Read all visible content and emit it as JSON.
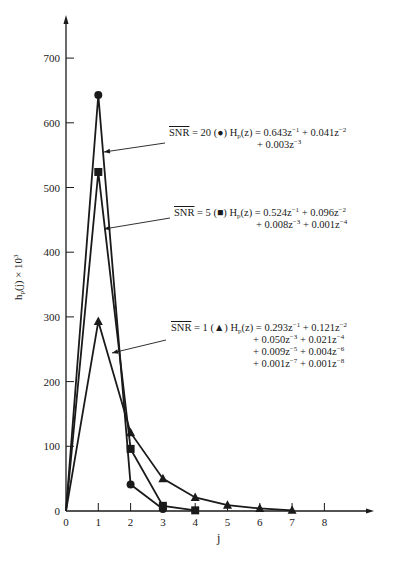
{
  "chart_data": {
    "type": "line",
    "title": "",
    "xlabel": "j",
    "ylabel": "h_p(j) × 10³",
    "xlim": [
      0,
      8.5
    ],
    "ylim": [
      0,
      750
    ],
    "x_ticks": [
      0,
      1,
      2,
      3,
      4,
      5,
      6,
      7,
      8
    ],
    "y_ticks": [
      0,
      100,
      200,
      300,
      400,
      500,
      600,
      700
    ],
    "grid": false,
    "legend": "inline annotations with arrows",
    "series": [
      {
        "name": "SNR = 20",
        "marker": "circle",
        "x": [
          0,
          1,
          2,
          3
        ],
        "values": [
          0,
          643,
          41,
          3
        ]
      },
      {
        "name": "SNR = 5",
        "marker": "square",
        "x": [
          0,
          1,
          2,
          3,
          4
        ],
        "values": [
          0,
          524,
          96,
          8,
          1
        ]
      },
      {
        "name": "SNR = 1",
        "marker": "triangle",
        "x": [
          0,
          1,
          2,
          3,
          4,
          5,
          6,
          7
        ],
        "values": [
          0,
          293,
          121,
          50,
          21,
          9,
          4,
          1
        ]
      }
    ],
    "annotations": [
      {
        "snr": "SNR",
        "snr_value": "= 20",
        "marker_glyph": "(●)",
        "lines": [
          "H_p(z) = 0.643z⁻¹ + 0.041z⁻²",
          "+ 0.003z⁻³"
        ]
      },
      {
        "snr": "SNR",
        "snr_value": "= 5",
        "marker_glyph": "(■)",
        "lines": [
          "H_p(z) = 0.524z⁻¹ + 0.096z⁻²",
          "+ 0.008z⁻³ + 0.001z⁻⁴"
        ]
      },
      {
        "snr": "SNR",
        "snr_value": "= 1",
        "marker_glyph": "(▲)",
        "lines": [
          "H_p(z) = 0.293z⁻¹ + 0.121z⁻²",
          "+ 0.050z⁻³ + 0.021z⁻⁴",
          "+ 0.009z⁻⁵ + 0.004z⁻⁶",
          "+ 0.001z⁻⁷ + 0.001z⁻⁸"
        ]
      }
    ]
  },
  "labels": {
    "x_axis": "j",
    "y_axis_main": "h",
    "y_axis_sub": "p",
    "y_axis_rest": "(j) × 10",
    "y_axis_exp": "3"
  },
  "annotations_text": {
    "a20": {
      "snr": "SNR",
      "rest": " = 20 (●) H",
      "sub": "p",
      "eq": "(z) = 0.643z",
      "e1": "−1",
      "t2": " + 0.041z",
      "e2": "−2",
      "c1": "+ 0.003z",
      "c1e": "−3"
    },
    "a5": {
      "snr": "SNR",
      "rest": " = 5 (■) H",
      "sub": "p",
      "eq": "(z) = 0.524z",
      "e1": "−1",
      "t2": " + 0.096z",
      "e2": "−2",
      "c1": "+ 0.008z",
      "c1e": "−3",
      "c2": " + 0.001z",
      "c2e": "−4"
    },
    "a1": {
      "snr": "SNR",
      "rest": " = 1 (▲) H",
      "sub": "p",
      "eq": "(z) = 0.293z",
      "e1": "−1",
      "t2": " + 0.121z",
      "e2": "−2",
      "c1": "+ 0.050z",
      "c1e": "−3",
      "c2": " + 0.021z",
      "c2e": "−4",
      "c3": "+ 0.009z",
      "c3e": "−5",
      "c4": " + 0.004z",
      "c4e": "−6",
      "c5": "+ 0.001z",
      "c5e": "−7",
      "c6": " + 0.001z",
      "c6e": "−8"
    }
  }
}
